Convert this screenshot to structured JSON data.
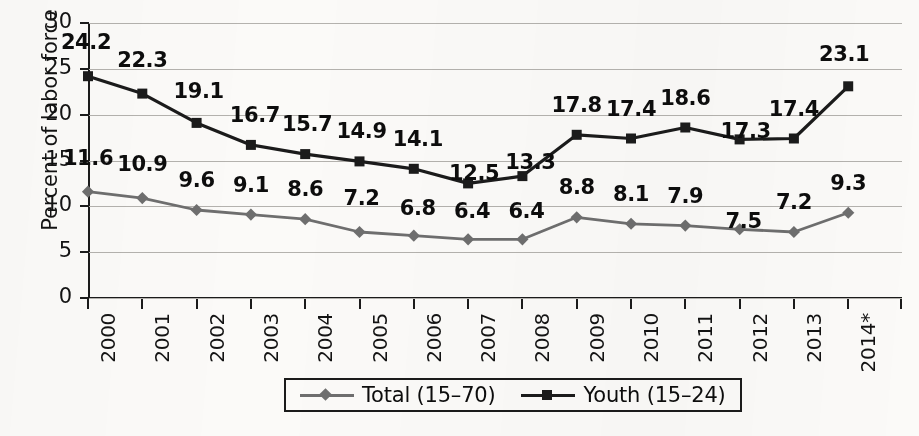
{
  "chart_data": {
    "type": "line",
    "title": "",
    "xlabel": "",
    "ylabel": "Percent of labor force",
    "categories": [
      "2000",
      "2001",
      "2002",
      "2003",
      "2004",
      "2005",
      "2006",
      "2007",
      "2008",
      "2009",
      "2010",
      "2011",
      "2012",
      "2013",
      "2014*"
    ],
    "ylim": [
      0,
      30
    ],
    "yticks": [
      0,
      5,
      10,
      15,
      20,
      25,
      30
    ],
    "grid": true,
    "legend_position": "bottom",
    "series": [
      {
        "name": "Total (15–70)",
        "marker": "diamond",
        "color": "#6e6e6e",
        "values": [
          11.6,
          10.9,
          9.6,
          9.1,
          8.6,
          7.2,
          6.8,
          6.4,
          6.4,
          8.8,
          8.1,
          7.9,
          7.5,
          7.2,
          9.3
        ],
        "labels": [
          "11.6",
          "10.9",
          "9.6",
          "9.1",
          "8.6",
          "7.2",
          "6.8",
          "6.4",
          "6.4",
          "8.8",
          "8.1",
          "7.9",
          "7.5",
          "7.2",
          "9.3"
        ]
      },
      {
        "name": "Youth (15–24)",
        "marker": "square",
        "color": "#1b1b1b",
        "values": [
          24.2,
          22.3,
          19.1,
          16.7,
          15.7,
          14.9,
          14.1,
          12.5,
          13.3,
          17.8,
          17.4,
          18.6,
          17.3,
          17.4,
          23.1
        ],
        "labels": [
          "24.2",
          "22.3",
          "19.1",
          "16.7",
          "15.7",
          "14.9",
          "14.1",
          "12.5",
          "13.3",
          "17.8",
          "17.4",
          "18.6",
          "17.3",
          "17.4",
          "23.1"
        ]
      }
    ]
  },
  "axis": {
    "y_title": "Percent of labor force",
    "y_tick_labels": [
      "30",
      "25",
      "20",
      "15",
      "10",
      "5",
      "0"
    ],
    "x_tick_labels": [
      "2000",
      "2001",
      "2002",
      "2003",
      "2004",
      "2005",
      "2006",
      "2007",
      "2008",
      "2009",
      "2010",
      "2011",
      "2012",
      "2013",
      "2014*"
    ]
  },
  "legend": {
    "entries": [
      {
        "label": "Total (15–70)",
        "marker": "diamond-marker",
        "color": "#6e6e6e"
      },
      {
        "label": "Youth (15–24)",
        "marker": "square-marker",
        "color": "#1b1b1b"
      }
    ]
  },
  "colors": {
    "total_series": "#6e6e6e",
    "youth_series": "#1b1b1b",
    "gridline": "#b4b2ae",
    "axis": "#1b1b1b",
    "background": "#fbfaf8"
  }
}
